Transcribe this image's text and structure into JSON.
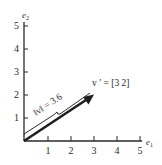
{
  "diagram": {
    "type": "vector-plot",
    "x_axis": {
      "label": "e",
      "subscript": "1",
      "ticks": [
        "1",
        "2",
        "3",
        "4",
        "5"
      ]
    },
    "y_axis": {
      "label": "e",
      "subscript": "2",
      "ticks": [
        "1",
        "2",
        "3",
        "4",
        "5"
      ]
    },
    "vector": {
      "label": "v ′ = [3 2]",
      "components": [
        3,
        2
      ],
      "tail": [
        0,
        0
      ],
      "head": [
        3,
        2
      ]
    },
    "norm": {
      "label": "‖v‖ = 3.6",
      "value": 3.6
    },
    "colors": {
      "ink": "#2a2a2a",
      "background": "#ffffff"
    }
  }
}
